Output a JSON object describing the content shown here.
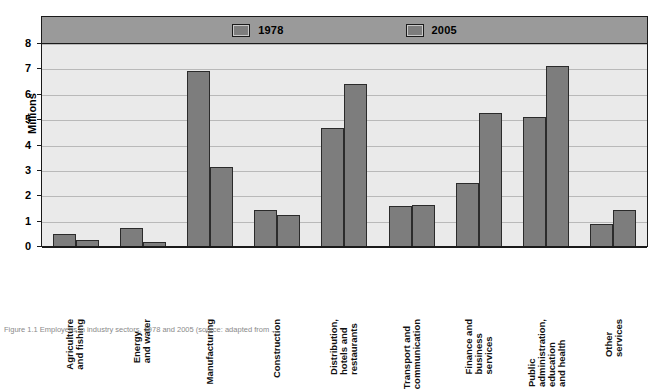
{
  "chart_data": {
    "type": "bar",
    "title": "",
    "xlabel": "",
    "ylabel": "Millions",
    "ylim": [
      0,
      8
    ],
    "yticks": [
      "0",
      "1",
      "2",
      "3",
      "4",
      "5",
      "6",
      "7",
      "8"
    ],
    "grid": true,
    "legend_position": "top",
    "categories": [
      "Agriculture and fishing",
      "Energy and water",
      "Manufacturing",
      "Construction",
      "Distribution, hotels and restaurants",
      "Transport and communication",
      "Finance and business services",
      "Public administration, education and health",
      "Other services"
    ],
    "category_lines": [
      [
        "Agriculture",
        "and fishing"
      ],
      [
        "Energy",
        "and water"
      ],
      [
        "Manufacturing"
      ],
      [
        "Construction"
      ],
      [
        "Distribution,",
        "hotels and",
        "restaurants"
      ],
      [
        "Transport and",
        "communication"
      ],
      [
        "Finance and",
        "business",
        "services"
      ],
      [
        "Public",
        "administration,",
        "education",
        "and health"
      ],
      [
        "Other",
        "services"
      ]
    ],
    "series": [
      {
        "name": "1978",
        "color": "#7d7d7d",
        "values": [
          0.48,
          0.72,
          6.88,
          1.4,
          4.67,
          1.58,
          2.5,
          5.1,
          0.88
        ]
      },
      {
        "name": "2005",
        "color": "#7d7d7d",
        "values": [
          0.25,
          0.15,
          3.12,
          1.22,
          6.4,
          1.62,
          5.25,
          7.1,
          1.42
        ]
      }
    ]
  },
  "legend": {
    "items": [
      {
        "label": "1978"
      },
      {
        "label": "2005"
      }
    ]
  },
  "axis": {
    "y_title": "Millions"
  },
  "caption": {
    "text": "Figure 1.1 Employees in industry sectors, 1978 and 2005 (source: adapted from ..."
  },
  "colors": {
    "bar_fill": "#7d7d7d",
    "bar_stroke": "#2b2b2b",
    "plot_background": "#eaeaea",
    "legend_band": "#9a9a9a",
    "gridline": "#b9b9b9",
    "axis": "#1a1a1a"
  }
}
